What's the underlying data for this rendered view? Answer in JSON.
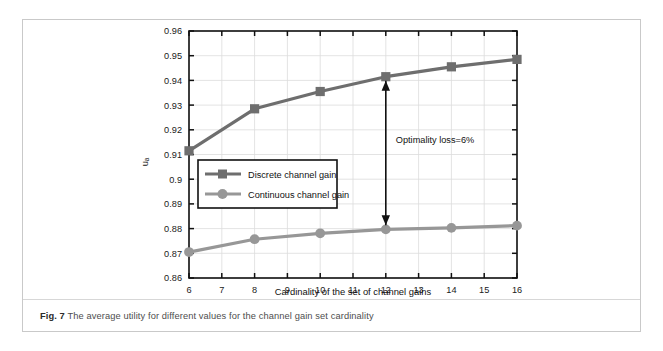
{
  "caption": {
    "label": "Fig. 7",
    "text": " The average utility for different values for the channel gain set cardinality"
  },
  "chart_data": {
    "type": "line",
    "title": "",
    "xlabel": "Cardinality of the set of channel gains",
    "ylabel": "uₐ",
    "x": [
      6,
      8,
      10,
      12,
      14,
      16
    ],
    "xlim": [
      6,
      16
    ],
    "ylim": [
      0.86,
      0.96
    ],
    "xticks": [
      "6",
      "7",
      "8",
      "9",
      "10",
      "11",
      "12",
      "13",
      "14",
      "15",
      "16"
    ],
    "xtick_values": [
      6,
      7,
      8,
      9,
      10,
      11,
      12,
      13,
      14,
      15,
      16
    ],
    "yticks": [
      "0.86",
      "0.87",
      "0.88",
      "0.89",
      "0.9",
      "0.91",
      "0.92",
      "0.93",
      "0.94",
      "0.95",
      "0.96"
    ],
    "ytick_values": [
      0.86,
      0.87,
      0.88,
      0.89,
      0.9,
      0.91,
      0.92,
      0.93,
      0.94,
      0.95,
      0.96
    ],
    "grid": true,
    "legend_position": "center-left",
    "series": [
      {
        "name": "Discrete channel gain",
        "marker": "square",
        "color": "#6e6e6e",
        "values": [
          0.9115,
          0.9285,
          0.9355,
          0.9415,
          0.9455,
          0.9485
        ]
      },
      {
        "name": "Continuous channel gain",
        "marker": "circle",
        "color": "#979797",
        "values": [
          0.8705,
          0.8757,
          0.8781,
          0.8797,
          0.8803,
          0.8812
        ]
      }
    ],
    "annotations": [
      {
        "text": "Optimality loss=6%",
        "x": 12,
        "y_top": 0.9415,
        "y_bottom": 0.8797,
        "style": "double-arrow"
      }
    ]
  },
  "colors": {
    "discrete": "#6e6e6e",
    "continuous": "#979797",
    "axis": "#111111",
    "grid": "#dcdcdc",
    "panel_border": "#c9c9c9"
  }
}
